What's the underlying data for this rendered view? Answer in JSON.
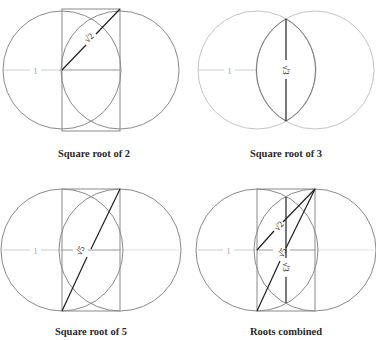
{
  "figure": {
    "panels": [
      {
        "id": "sqrt2",
        "caption": "Square root of 2",
        "radius_label": "1",
        "root_labels": [
          "√2"
        ]
      },
      {
        "id": "sqrt3",
        "caption": "Square root of 3",
        "radius_label": "1",
        "root_labels": [
          "√3"
        ]
      },
      {
        "id": "sqrt5",
        "caption": "Square root of 5",
        "radius_label": "1",
        "root_labels": [
          "√5"
        ]
      },
      {
        "id": "combined",
        "caption": "Roots combined",
        "radius_label": "1",
        "root_labels": [
          "√2",
          "√5",
          "√3"
        ]
      }
    ],
    "colors": {
      "circle": "#8a8a8a",
      "circle_light": "#c4c4c4",
      "radius_line": "#cccccc",
      "root_line": "#1e1e1e",
      "caption": "#2a2a2a"
    }
  }
}
